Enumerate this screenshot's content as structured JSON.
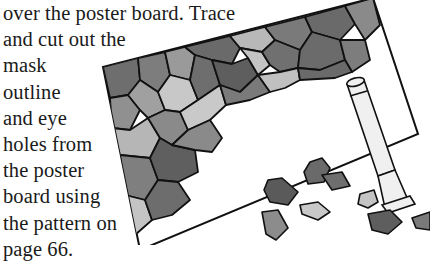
{
  "document": {
    "instruction_lines": [
      "over the poster board. Trace",
      "and cut out the",
      "mask",
      "outline",
      "and eye",
      "holes from",
      "the poster",
      "board using",
      "the pattern on",
      "page 66."
    ]
  },
  "illustration": {
    "subject": "poster board partially covered with gray paper tiles, a glue stick, and scattered cut tiles",
    "colors": {
      "outline": "#111111",
      "tile_dark": "#6e6e6e",
      "tile_mid": "#8c8c8c",
      "tile_light": "#c8c8c8",
      "board": "#ffffff",
      "glue_stick": "#f2f2f2"
    }
  }
}
